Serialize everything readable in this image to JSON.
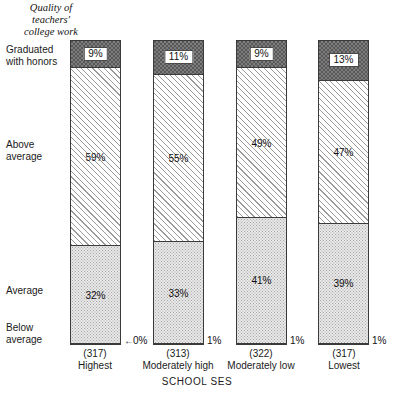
{
  "chart_data": {
    "type": "bar",
    "subtype": "stacked-bar-100",
    "title": "Quality of\nteachers'\ncollege work",
    "xlabel": "SCHOOL SES",
    "ylabel": "",
    "ylim": [
      0,
      100
    ],
    "grid": false,
    "legend_position": "y-axis-labels",
    "categories": [
      "Highest",
      "Moderately high",
      "Moderately low",
      "Lowest"
    ],
    "category_counts": [
      "(317)",
      "(313)",
      "(322)",
      "(317)"
    ],
    "series": [
      {
        "name": "Graduated with honors",
        "values": [
          9,
          11,
          9,
          13
        ]
      },
      {
        "name": "Above average",
        "values": [
          59,
          55,
          49,
          47
        ]
      },
      {
        "name": "Average",
        "values": [
          32,
          33,
          41,
          39
        ]
      },
      {
        "name": "Below average",
        "values": [
          0,
          1,
          1,
          1
        ]
      }
    ],
    "series_labels": [
      [
        "9%",
        "11%",
        "9%",
        "13%"
      ],
      [
        "59%",
        "55%",
        "49%",
        "47%"
      ],
      [
        "32%",
        "33%",
        "41%",
        "39%"
      ],
      [
        "0%",
        "1%",
        "1%",
        "1%"
      ]
    ],
    "annotations": [
      {
        "text": "0%",
        "arrow": "←",
        "target": "Highest / Below average"
      },
      {
        "text": "1%",
        "arrow": "",
        "target": "Moderately high / Below average"
      },
      {
        "text": "1%",
        "arrow": "",
        "target": "Moderately low / Below average"
      },
      {
        "text": "1%",
        "arrow": "",
        "target": "Lowest / Below average"
      }
    ]
  },
  "title": {
    "line1": "Quality of",
    "line2": "teachers'",
    "line3": "college work",
    "full": "Quality of\nteachers'\ncollege work"
  },
  "category_labels": {
    "honors": "Graduated\nwith honors",
    "above": "Above\naverage",
    "average": "Average",
    "below": "Below\naverage"
  },
  "bars": [
    {
      "key": "highest",
      "count": "(317)",
      "name": "Highest",
      "honors": "9%",
      "above": "59%",
      "average": "32%",
      "below": "0%",
      "below_arrow": "←"
    },
    {
      "key": "moderately-high",
      "count": "(313)",
      "name": "Moderately high",
      "honors": "11%",
      "above": "55%",
      "average": "33%",
      "below": "1%",
      "below_arrow": ""
    },
    {
      "key": "moderately-low",
      "count": "(322)",
      "name": "Moderately low",
      "honors": "9%",
      "above": "49%",
      "average": "41%",
      "below": "1%",
      "below_arrow": ""
    },
    {
      "key": "lowest",
      "count": "(317)",
      "name": "Lowest",
      "honors": "13%",
      "above": "47%",
      "average": "39%",
      "below": "1%",
      "below_arrow": ""
    }
  ],
  "axis": {
    "x_title": "SCHOOL SES"
  },
  "colors": {
    "honors_fill": "#585858",
    "above_fill": "#ffffff",
    "average_fill": "#e8e8e8",
    "below_fill": "#4a4a4a",
    "outline": "#3a3a3a",
    "text": "#1a1a1a",
    "background": "#ffffff"
  }
}
